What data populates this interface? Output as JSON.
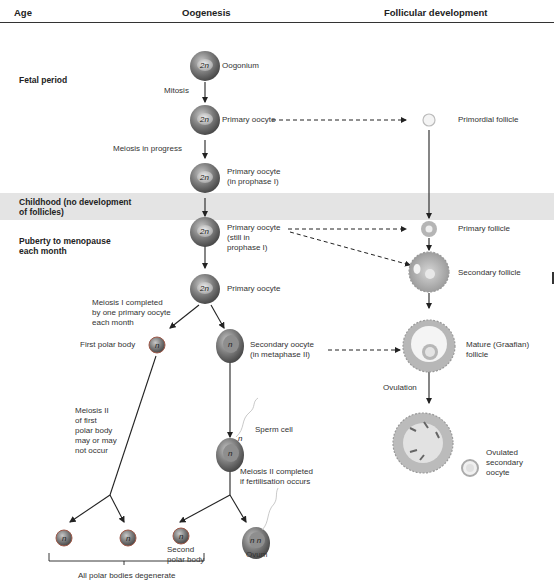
{
  "header": {
    "age": "Age",
    "oogenesis": "Oogenesis",
    "follicular": "Follicular development"
  },
  "ages": {
    "fetal": "Fetal period",
    "childhood_1": "Childhood (no development",
    "childhood_2": "of follicles)",
    "puberty_1": "Puberty to menopause",
    "puberty_2": "each month"
  },
  "oogenesis": {
    "oogonium": "Oogonium",
    "mitosis": "Mitosis",
    "primary_oocyte_1": "Primary oocyte",
    "meiosis_in_progress": "Meiosis in progress",
    "primary_oocyte_prophase_1": "Primary oocyte",
    "primary_oocyte_prophase_2": "(in prophase I)",
    "primary_oocyte_still_1": "Primary oocyte",
    "primary_oocyte_still_2": "(still in",
    "primary_oocyte_still_3": "prophase I)",
    "primary_oocyte_2": "Primary oocyte",
    "meiosis1_1": "Meiosis I completed",
    "meiosis1_2": "by one primary oocyte",
    "meiosis1_3": "each month",
    "first_polar_body": "First polar body",
    "secondary_oocyte_1": "Secondary oocyte",
    "secondary_oocyte_2": "(in metaphase II)",
    "meiosis2_first_1": "Meiosis II",
    "meiosis2_first_2": "of first",
    "meiosis2_first_3": "polar body",
    "meiosis2_first_4": "may or may",
    "meiosis2_first_5": "not occur",
    "sperm_cell": "Sperm cell",
    "meiosis2_completed_1": "Meiosis II completed",
    "meiosis2_completed_2": "if fertilisation occurs",
    "second_polar_body_1": "Second",
    "second_polar_body_2": "polar body",
    "ovum": "Ovum",
    "all_degenerate": "All polar bodies degenerate"
  },
  "follicular": {
    "primordial": "Primordial follicle",
    "primary": "Primary follicle",
    "secondary": "Secondary follicle",
    "mature_1": "Mature (Graafian)",
    "mature_2": "follicle",
    "ovulation": "Ovulation",
    "ovulated_1": "Ovulated",
    "ovulated_2": "secondary",
    "ovulated_3": "oocyte"
  },
  "cell_labels": {
    "diploid": "2n",
    "haploid": "n",
    "zygote": "n n"
  },
  "colors": {
    "header_rule": "#333333",
    "band": "#e4e4e4",
    "cell_outer": "#a05a4a",
    "cell_inner": "#8a8a8a",
    "follicle": "#b9b9b9"
  }
}
